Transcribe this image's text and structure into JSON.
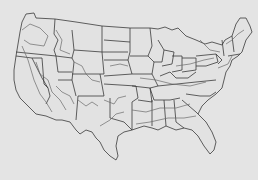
{
  "map": {
    "subject": "United States (contiguous) outline with state borders and zone contour lines",
    "colors": {
      "background": "#e4e4e4",
      "land": "#e2e2e2",
      "border": "#3a3a3a",
      "contour": "#6a6a6a"
    }
  }
}
